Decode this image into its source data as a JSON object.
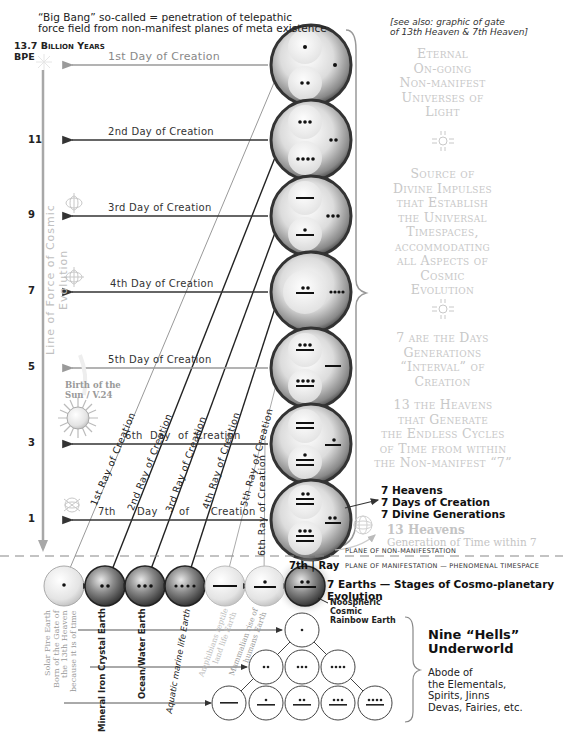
{
  "header": {
    "note_line1": "“Big Bang” so-called = penetration of telepathic",
    "note_line2": "force field from non-manifest planes of meta existence",
    "time_line1": "13.7 Billion Years",
    "time_line2": "BPE",
    "see_also_line1": "[see also: graphic of gate",
    "see_also_line2": "of 13th Heaven & 7th Heaven]"
  },
  "axis": {
    "label": "Line of Force of Cosmic Evolution",
    "ticks": [
      {
        "label": "11",
        "y": 140
      },
      {
        "label": "9",
        "y": 215
      },
      {
        "label": "7",
        "y": 291
      },
      {
        "label": "5",
        "y": 367
      },
      {
        "label": "3",
        "y": 443
      },
      {
        "label": "1",
        "y": 519
      }
    ]
  },
  "days": [
    {
      "label": "1st Day of Creation",
      "y": 65,
      "shade": "grey"
    },
    {
      "label": "2nd Day of Creation",
      "y": 140,
      "shade": "dark"
    },
    {
      "label": "3rd Day of Creation",
      "y": 216,
      "shade": "dark"
    },
    {
      "label": "4th Day of Creation",
      "y": 292,
      "shade": "dark"
    },
    {
      "label": "5th Day of Creation",
      "y": 368,
      "shade": "grey"
    },
    {
      "label": "6th Day of Creation",
      "y": 444,
      "shade": "dark"
    },
    {
      "label": "7th Day of Creation",
      "y": 520,
      "shade": "dark"
    }
  ],
  "rays": [
    {
      "label": "1st Ray of Creation"
    },
    {
      "label": "2nd Ray of Creation"
    },
    {
      "label": "3rd Ray of Creation"
    },
    {
      "label": "4th Ray of Creation"
    },
    {
      "label": "5th Ray of Creation"
    },
    {
      "label": "6th Ray of Creation"
    },
    {
      "label_a": "7th",
      "label_b": "Ray"
    }
  ],
  "heavens": [
    {
      "top": "1",
      "side": "1",
      "bottom": "2"
    },
    {
      "top": "3",
      "side": "2",
      "bottom": "4"
    },
    {
      "top": "5",
      "side": "3",
      "bottom": "6"
    },
    {
      "center": "7",
      "side": "4"
    },
    {
      "top": "8",
      "side": "5",
      "bottom": "9"
    },
    {
      "top": "10",
      "side": "6",
      "bottom": "11"
    },
    {
      "top": "12",
      "side": "7",
      "bottom": "13"
    }
  ],
  "right_panel": {
    "block1": [
      "Eternal",
      "On-going",
      "Non-manifest",
      "Universes of",
      "Light"
    ],
    "block2": [
      "Source of",
      "Divine Impulses",
      "that Establish",
      "the Universal",
      "Timespaces,",
      "accommodating",
      "all Aspects of",
      "Cosmic",
      "Evolution"
    ],
    "block3": [
      "7 are the Days",
      "Generations",
      "“Interval” of",
      "Creation"
    ],
    "block4": [
      "13 the Heavens",
      "that Generate",
      "the Endless Cycles",
      "of Time from within",
      "the Non-manifest “7”"
    ],
    "sevens": [
      "7 Heavens",
      "7 Days of Creation",
      "7 Divine Generations"
    ],
    "heavens13_title": "13 Heavens",
    "heavens13_sub": "Generation of Time within 7"
  },
  "planes": {
    "non_manifest": "Plane of Non-manifestation",
    "manifest": "Plane of Manifestation — Phenomenal Timespace"
  },
  "earths": {
    "title": "7 Earths — Stages of Cosmo-planetary Evolution",
    "items": [
      {
        "numeral": "1",
        "label": "Solar Fire Earth\nBorn of the Gate of\nthe 13th Heaven\nbecause it is of time",
        "shade": "grey"
      },
      {
        "numeral": "2",
        "label": "Mineral Iron Crystal Earth",
        "shade": "dark"
      },
      {
        "numeral": "3",
        "label": "Ocean/Water Earth",
        "shade": "dark"
      },
      {
        "numeral": "4",
        "label": "Aquatic marine life Earth",
        "shade": "dark"
      },
      {
        "numeral": "5",
        "label": "Amphibians reptile\nland life Earth",
        "shade": "grey"
      },
      {
        "numeral": "6",
        "label": "Mammalian rise of\nhumans Earth",
        "shade": "grey"
      },
      {
        "numeral": "7",
        "label": "Noospheric Cosmic Rainbow Earth",
        "shade": "dark"
      }
    ],
    "noos_line1": "Noospheric",
    "noos_line2": "Cosmic",
    "noos_line3": "Rainbow Earth"
  },
  "underworld": {
    "title_line1": "Nine “Hells”",
    "title_line2": "Underworld",
    "desc": [
      "Abode of",
      "the Elementals,",
      "Spirits, Jinns",
      "Devas, Fairies, etc."
    ],
    "circles": [
      "1",
      "2",
      "3",
      "4",
      "5",
      "6",
      "7",
      "8",
      "9"
    ]
  },
  "sun": {
    "label_line1": "Birth of the",
    "label_line2": "Sun / V.24"
  },
  "colors": {
    "dark_line": "#333333",
    "grey_line": "#9a9a9a",
    "light_text": "#c8c8c8",
    "sphere_dark": "#3a3a3a",
    "sphere_light": "#f2f2f2"
  }
}
